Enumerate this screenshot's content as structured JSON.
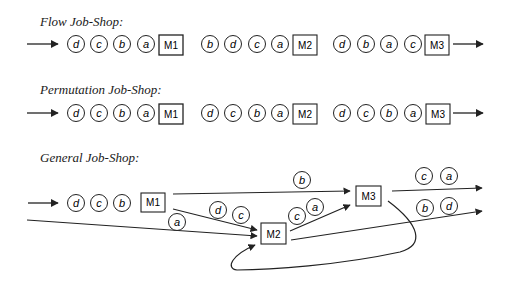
{
  "sections": {
    "flow": {
      "title": "Flow Job-Shop:",
      "machines": [
        {
          "label": "M1",
          "queue": [
            "d",
            "c",
            "b",
            "a"
          ]
        },
        {
          "label": "M2",
          "queue": [
            "b",
            "d",
            "c",
            "a"
          ]
        },
        {
          "label": "M3",
          "queue": [
            "d",
            "b",
            "a",
            "c"
          ]
        }
      ]
    },
    "permutation": {
      "title": "Permutation Job-Shop:",
      "machines": [
        {
          "label": "M1",
          "queue": [
            "d",
            "c",
            "b",
            "a"
          ]
        },
        {
          "label": "M2",
          "queue": [
            "d",
            "c",
            "b",
            "a"
          ]
        },
        {
          "label": "M3",
          "queue": [
            "d",
            "c",
            "b",
            "a"
          ]
        }
      ]
    },
    "general": {
      "title": "General  Job-Shop:",
      "machines": {
        "m1": "M1",
        "m2": "M2",
        "m3": "M3"
      },
      "m1_queue": [
        "d",
        "c",
        "b"
      ],
      "edge_labels": {
        "m1_to_m3": [
          "b"
        ],
        "m1_to_m2": [
          "d",
          "c"
        ],
        "input_to_m2": [
          "a"
        ],
        "m2_to_m3": [
          "c",
          "a"
        ],
        "m3_out": [
          "c",
          "a"
        ],
        "m2_out": [
          "b",
          "d"
        ]
      }
    }
  },
  "colors": {
    "stroke": "#222222",
    "text": "#1a1a1a",
    "background": "#ffffff"
  }
}
